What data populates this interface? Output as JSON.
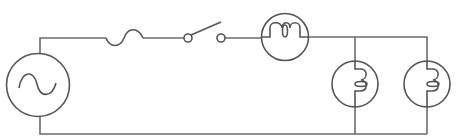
{
  "diagram": {
    "type": "circuit-schematic",
    "colors": {
      "background": "#ffffff",
      "wire": "#6b6b6b",
      "symbol": "#555555"
    },
    "components": [
      {
        "id": "ac-source",
        "label": "AC voltage source",
        "symbol": "circle with sine wave"
      },
      {
        "id": "fuse",
        "label": "Fuse",
        "symbol": "S-curve"
      },
      {
        "id": "switch",
        "label": "Switch (open)",
        "symbol": "two terminals with raised blade"
      },
      {
        "id": "lamp-series",
        "label": "Lamp (series)",
        "symbol": "circle with filament"
      },
      {
        "id": "lamp-parallel-1",
        "label": "Lamp (parallel 1)",
        "symbol": "circle with filament"
      },
      {
        "id": "lamp-parallel-2",
        "label": "Lamp (parallel 2)",
        "symbol": "circle with filament"
      }
    ]
  }
}
